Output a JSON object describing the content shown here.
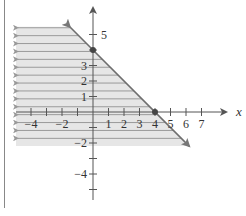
{
  "chart_data": {
    "type": "inequality-graph",
    "title": "",
    "xlabel": "x",
    "ylabel": "",
    "xlim": [
      -5,
      8
    ],
    "ylim": [
      -5.5,
      6
    ],
    "grid": false,
    "x_ticks": [
      -4,
      -3,
      -2,
      -1,
      1,
      2,
      3,
      4,
      5,
      6,
      7
    ],
    "x_tick_labels": [
      "-4",
      "-2",
      "1",
      "2",
      "3",
      "4",
      "5",
      "6",
      "7"
    ],
    "x_tick_label_values": [
      -4,
      -2,
      1,
      2,
      3,
      4,
      5,
      6,
      7
    ],
    "y_ticks": [
      -5,
      -4,
      -3,
      -2,
      -1,
      1,
      2,
      3,
      4,
      5
    ],
    "y_tick_labels": [
      "5",
      "3",
      "2",
      "1",
      "-2",
      "-4"
    ],
    "y_tick_label_values": [
      5,
      3,
      2,
      1,
      -2,
      -4
    ],
    "boundary_line": {
      "equation": "x + y = 4",
      "slope": -1,
      "intercept": 4,
      "start": [
        -1.5,
        5.5
      ],
      "end": [
        6.2,
        -2.2
      ],
      "style": "solid",
      "arrows": "both"
    },
    "points": [
      {
        "label": "y-intercept",
        "x": 0,
        "y": 4
      },
      {
        "label": "x-intercept",
        "x": 4,
        "y": 0
      }
    ],
    "shaded_region": {
      "side": "left-below",
      "inequality": "x + y <= 4",
      "pattern": "horizontal lines with left arrows",
      "y_from": -2.2,
      "y_to": 5.5
    }
  },
  "colors": {
    "shade_fill": "#e6e6e6",
    "shade_line": "#9a9a9a",
    "boundary": "#6e6e6e",
    "axis": "#555555",
    "point": "#444444",
    "frame": "#888888"
  }
}
